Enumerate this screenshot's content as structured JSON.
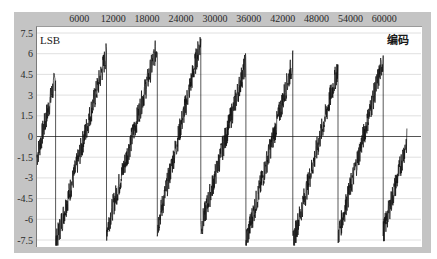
{
  "chart_data": {
    "type": "line",
    "title": "",
    "xlabel": "",
    "ylabel": "LSB",
    "legend": [
      "编码"
    ],
    "legend_position": "top-right",
    "x_axis_position": "top",
    "xlim": [
      -1500,
      66500
    ],
    "ylim": [
      -7.5,
      7.5
    ],
    "x_ticks": [
      6000,
      12000,
      18000,
      24000,
      30000,
      36000,
      42000,
      48000,
      54000,
      60000
    ],
    "y_ticks": [
      7.5,
      6,
      4.5,
      3,
      1.5,
      0,
      -1.5,
      -3,
      -4.5,
      -6,
      -7.5
    ],
    "grid": {
      "horizontal": true,
      "vertical": false
    },
    "series": [
      {
        "name": "编码",
        "color": "#111111",
        "segments": [
          {
            "x_start": -1500,
            "x_end": 1800,
            "y_start": -1.5,
            "y_end": 4.3
          },
          {
            "x_start": 1800,
            "x_end": 10800,
            "y_start": -7.8,
            "y_end": 6.0
          },
          {
            "x_start": 10800,
            "x_end": 19800,
            "y_start": -6.8,
            "y_end": 6.6
          },
          {
            "x_start": 19800,
            "x_end": 27500,
            "y_start": -6.6,
            "y_end": 7.0
          },
          {
            "x_start": 27500,
            "x_end": 35500,
            "y_start": -6.7,
            "y_end": 5.4
          },
          {
            "x_start": 35500,
            "x_end": 43800,
            "y_start": -7.6,
            "y_end": 5.4
          },
          {
            "x_start": 43800,
            "x_end": 51800,
            "y_start": -7.7,
            "y_end": 5.0
          },
          {
            "x_start": 51800,
            "x_end": 59800,
            "y_start": -7.2,
            "y_end": 5.6
          },
          {
            "x_start": 59800,
            "x_end": 64000,
            "y_start": -7.0,
            "y_end": -0.3
          }
        ]
      }
    ]
  },
  "labels": {
    "y_unit": "LSB",
    "legend": "编码"
  }
}
